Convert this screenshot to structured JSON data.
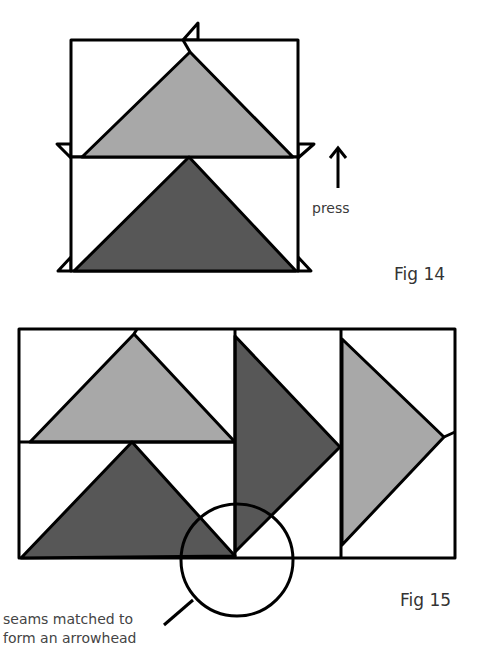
{
  "figures": [
    {
      "id": "fig14",
      "caption": "Fig 14",
      "annotation": "press",
      "annotation_icon": "arrow-up-icon"
    },
    {
      "id": "fig15",
      "caption": "Fig 15",
      "callout": [
        "seams matched to",
        "form an arrowhead"
      ]
    }
  ],
  "colors": {
    "light_fabric": "#a8a8a8",
    "dark_fabric": "#575757",
    "outline": "#000000",
    "background": "#ffffff"
  }
}
